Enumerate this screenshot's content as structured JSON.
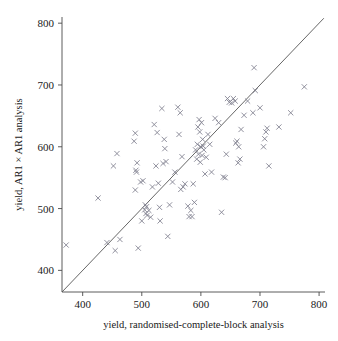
{
  "chart_data": {
    "type": "scatter",
    "title": "",
    "xlabel": "yield, randomised-complete-block analysis",
    "ylabel": "yield, AR1 × AR1 analysis",
    "xlim": [
      365,
      810
    ],
    "ylim": [
      365,
      810
    ],
    "xticks": [
      400,
      500,
      600,
      700,
      800
    ],
    "yticks": [
      400,
      500,
      600,
      700,
      800
    ],
    "xtick_labels": [
      "400",
      "500",
      "600",
      "700",
      "800"
    ],
    "ytick_labels": [
      "400",
      "500",
      "600",
      "700",
      "800"
    ],
    "grid": false,
    "legend": null,
    "marker": "x",
    "marker_color": "#7d7d8c",
    "reference_line": {
      "name": "one-to-one-line",
      "type": "identity",
      "slope": 1,
      "intercept": 0,
      "from": [
        365,
        365
      ],
      "to": [
        808,
        808
      ],
      "color": "#555555"
    },
    "points": [
      [
        372,
        441
      ],
      [
        426,
        517
      ],
      [
        441,
        445
      ],
      [
        452,
        569
      ],
      [
        455,
        432
      ],
      [
        458,
        589
      ],
      [
        463,
        450
      ],
      [
        487,
        609
      ],
      [
        489,
        530
      ],
      [
        489,
        622
      ],
      [
        490,
        562
      ],
      [
        491,
        559
      ],
      [
        492,
        574
      ],
      [
        494,
        436
      ],
      [
        498,
        543
      ],
      [
        500,
        480
      ],
      [
        502,
        545
      ],
      [
        505,
        498
      ],
      [
        506,
        506
      ],
      [
        507,
        492
      ],
      [
        508,
        503
      ],
      [
        509,
        489
      ],
      [
        512,
        497
      ],
      [
        515,
        486
      ],
      [
        518,
        535
      ],
      [
        521,
        636
      ],
      [
        524,
        569
      ],
      [
        526,
        623
      ],
      [
        528,
        541
      ],
      [
        530,
        502
      ],
      [
        531,
        480
      ],
      [
        534,
        662
      ],
      [
        536,
        573
      ],
      [
        538,
        612
      ],
      [
        539,
        597
      ],
      [
        541,
        576
      ],
      [
        544,
        455
      ],
      [
        547,
        506
      ],
      [
        552,
        543
      ],
      [
        556,
        559
      ],
      [
        561,
        664
      ],
      [
        563,
        620
      ],
      [
        565,
        655
      ],
      [
        566,
        531
      ],
      [
        568,
        584
      ],
      [
        570,
        535
      ],
      [
        573,
        540
      ],
      [
        578,
        504
      ],
      [
        580,
        487
      ],
      [
        583,
        497
      ],
      [
        585,
        487
      ],
      [
        587,
        540
      ],
      [
        589,
        510
      ],
      [
        591,
        595
      ],
      [
        593,
        580
      ],
      [
        594,
        604
      ],
      [
        595,
        632
      ],
      [
        596,
        588
      ],
      [
        597,
        644
      ],
      [
        598,
        624
      ],
      [
        599,
        575
      ],
      [
        600,
        600
      ],
      [
        601,
        639
      ],
      [
        602,
        586
      ],
      [
        603,
        612
      ],
      [
        604,
        601
      ],
      [
        605,
        595
      ],
      [
        607,
        556
      ],
      [
        609,
        583
      ],
      [
        612,
        620
      ],
      [
        615,
        604
      ],
      [
        618,
        559
      ],
      [
        624,
        646
      ],
      [
        630,
        639
      ],
      [
        635,
        494
      ],
      [
        638,
        551
      ],
      [
        641,
        550
      ],
      [
        643,
        588
      ],
      [
        645,
        678
      ],
      [
        648,
        672
      ],
      [
        652,
        671
      ],
      [
        655,
        678
      ],
      [
        658,
        674
      ],
      [
        659,
        606
      ],
      [
        661,
        609
      ],
      [
        663,
        574
      ],
      [
        664,
        600
      ],
      [
        666,
        580
      ],
      [
        668,
        628
      ],
      [
        673,
        651
      ],
      [
        679,
        674
      ],
      [
        688,
        655
      ],
      [
        690,
        728
      ],
      [
        692,
        691
      ],
      [
        700,
        663
      ],
      [
        706,
        600
      ],
      [
        708,
        613
      ],
      [
        710,
        624
      ],
      [
        712,
        630
      ],
      [
        715,
        569
      ],
      [
        732,
        632
      ],
      [
        752,
        655
      ],
      [
        775,
        697
      ]
    ]
  }
}
